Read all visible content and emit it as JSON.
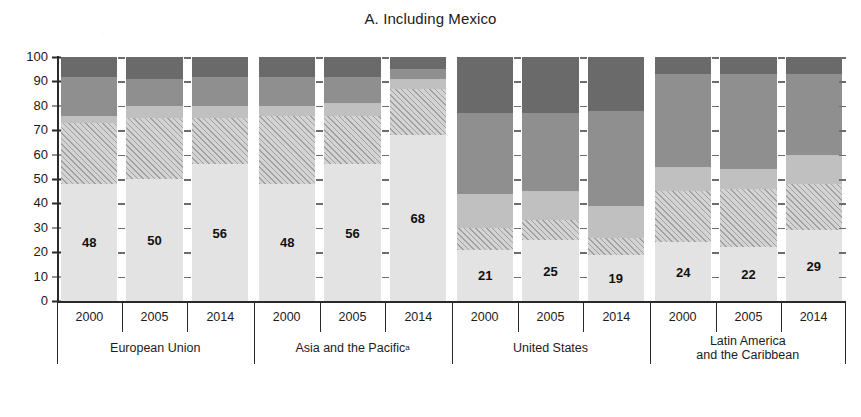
{
  "chart_data": {
    "type": "bar",
    "title": "A. Including Mexico",
    "xlabel": "",
    "ylabel": "",
    "ylim": [
      0,
      100
    ],
    "yticks": [
      0,
      10,
      20,
      30,
      40,
      50,
      60,
      70,
      80,
      90,
      100
    ],
    "grid": false,
    "legend": "none",
    "stacked": true,
    "stack_order_bottom_to_top": [
      "segment1",
      "segment2",
      "segment3",
      "segment4",
      "segment5"
    ],
    "categories": [
      "2000",
      "2005",
      "2014",
      "2000",
      "2005",
      "2014",
      "2000",
      "2005",
      "2014",
      "2000",
      "2005",
      "2014"
    ],
    "groups": [
      {
        "label": "European Union",
        "superscript": "",
        "years": [
          "2000",
          "2005",
          "2014"
        ]
      },
      {
        "label": "Asia and the Pacific",
        "superscript": "a",
        "years": [
          "2000",
          "2005",
          "2014"
        ]
      },
      {
        "label": "United States",
        "superscript": "",
        "years": [
          "2000",
          "2005",
          "2014"
        ]
      },
      {
        "label": "Latin America and the Caribbean",
        "label_line1": "Latin America",
        "label_line2": "and the Caribbean",
        "superscript": "",
        "years": [
          "2000",
          "2005",
          "2014"
        ]
      }
    ],
    "bars": [
      {
        "group": "European Union",
        "year": "2000",
        "label": "48",
        "segments": [
          48,
          25,
          3,
          16,
          8
        ]
      },
      {
        "group": "European Union",
        "year": "2005",
        "label": "50",
        "segments": [
          50,
          25,
          5,
          11,
          9
        ]
      },
      {
        "group": "European Union",
        "year": "2014",
        "label": "56",
        "segments": [
          56,
          19,
          5,
          12,
          8
        ]
      },
      {
        "group": "Asia and the Pacific",
        "year": "2000",
        "label": "48",
        "segments": [
          48,
          28,
          4,
          12,
          8
        ]
      },
      {
        "group": "Asia and the Pacific",
        "year": "2005",
        "label": "56",
        "segments": [
          56,
          20,
          5,
          11,
          8
        ]
      },
      {
        "group": "Asia and the Pacific",
        "year": "2014",
        "label": "68",
        "segments": [
          68,
          19,
          4,
          4,
          5
        ]
      },
      {
        "group": "United States",
        "year": "2000",
        "label": "21",
        "segments": [
          21,
          9,
          14,
          33,
          23
        ]
      },
      {
        "group": "United States",
        "year": "2005",
        "label": "25",
        "segments": [
          25,
          8,
          12,
          32,
          23
        ]
      },
      {
        "group": "United States",
        "year": "2014",
        "label": "19",
        "segments": [
          19,
          7,
          13,
          39,
          22
        ]
      },
      {
        "group": "Latin America and the Caribbean",
        "year": "2000",
        "label": "24",
        "segments": [
          24,
          21,
          10,
          38,
          7
        ]
      },
      {
        "group": "Latin America and the Caribbean",
        "year": "2005",
        "label": "22",
        "segments": [
          22,
          24,
          8,
          39,
          7
        ]
      },
      {
        "group": "Latin America and the Caribbean",
        "year": "2014",
        "label": "29",
        "segments": [
          29,
          19,
          12,
          33,
          7
        ]
      }
    ],
    "series": [
      {
        "name": "segment1",
        "pattern": "blank-light",
        "values": [
          48,
          50,
          56,
          48,
          56,
          68,
          21,
          25,
          19,
          24,
          22,
          29
        ]
      },
      {
        "name": "segment2",
        "pattern": "diagonal-hatch",
        "values": [
          25,
          25,
          19,
          28,
          20,
          19,
          9,
          8,
          7,
          21,
          24,
          19
        ]
      },
      {
        "name": "segment3",
        "pattern": "light-gray",
        "values": [
          3,
          5,
          5,
          4,
          5,
          4,
          14,
          12,
          13,
          10,
          8,
          12
        ]
      },
      {
        "name": "segment4",
        "pattern": "mid-gray",
        "values": [
          16,
          11,
          12,
          12,
          11,
          4,
          33,
          32,
          39,
          38,
          39,
          33
        ]
      },
      {
        "name": "segment5",
        "pattern": "dark-gray",
        "values": [
          8,
          9,
          8,
          8,
          8,
          5,
          23,
          23,
          22,
          7,
          7,
          7
        ]
      }
    ],
    "colors": {
      "segment1": "#e3e3e3",
      "segment2": "#d3d3d3",
      "segment3": "#c0c0c0",
      "segment4": "#8f8f8f",
      "segment5": "#6a6a6a",
      "axis": "#2a2a2a",
      "text": "#1c1c1c"
    }
  }
}
